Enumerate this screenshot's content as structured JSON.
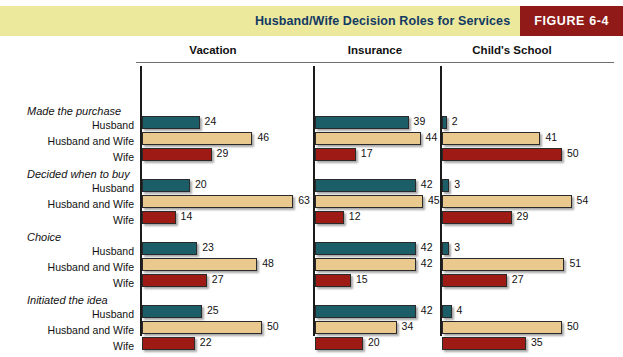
{
  "banner": {
    "title": "Husband/Wife Decision Roles for Services",
    "figure_label": "FIGURE  6-4",
    "band_color": "#ece89c",
    "figure_box_color": "#8f1a18",
    "title_color": "#123a63"
  },
  "chart_data": {
    "type": "bar",
    "orientation": "horizontal",
    "title": "Husband/Wife Decision Roles for Services",
    "xlabel": "",
    "ylabel": "",
    "xlim": [
      0,
      65
    ],
    "grid": false,
    "legend_position": "none",
    "value_unit": "percent",
    "columns": [
      "Vacation",
      "Insurance",
      "Child's School"
    ],
    "roles": [
      "Husband",
      "Husband and Wife",
      "Wife"
    ],
    "role_colors": {
      "Husband": "#1b5e68",
      "Husband and Wife": "#e9c98d",
      "Wife": "#9e1a14"
    },
    "groups": [
      {
        "name": "Made the purchase",
        "series": [
          {
            "name": "Husband",
            "values": [
              24,
              39,
              2
            ]
          },
          {
            "name": "Husband and Wife",
            "values": [
              46,
              44,
              41
            ]
          },
          {
            "name": "Wife",
            "values": [
              29,
              17,
              50
            ]
          }
        ]
      },
      {
        "name": "Decided when to buy",
        "series": [
          {
            "name": "Husband",
            "values": [
              20,
              42,
              3
            ]
          },
          {
            "name": "Husband and Wife",
            "values": [
              63,
              45,
              54
            ]
          },
          {
            "name": "Wife",
            "values": [
              14,
              12,
              29
            ]
          }
        ]
      },
      {
        "name": "Choice",
        "series": [
          {
            "name": "Husband",
            "values": [
              23,
              42,
              3
            ]
          },
          {
            "name": "Husband and Wife",
            "values": [
              48,
              42,
              51
            ]
          },
          {
            "name": "Wife",
            "values": [
              27,
              15,
              27
            ]
          }
        ]
      },
      {
        "name": "Initiated the idea",
        "series": [
          {
            "name": "Husband",
            "values": [
              25,
              42,
              4
            ]
          },
          {
            "name": "Husband and Wife",
            "values": [
              50,
              34,
              50
            ]
          },
          {
            "name": "Wife",
            "values": [
              22,
              20,
              35
            ]
          }
        ]
      }
    ]
  },
  "layout": {
    "panel_x": [
      140,
      313,
      440
    ],
    "panel_header_x": [
      213,
      375,
      512
    ],
    "group_y": [
      66,
      129,
      192,
      255
    ],
    "px_per_unit": 2.4,
    "bar_height": 13,
    "bar_gap": 3
  }
}
